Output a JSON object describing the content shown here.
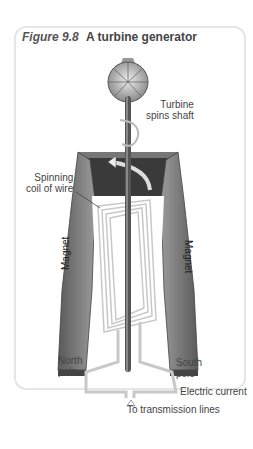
{
  "figure": {
    "number": "Figure 9.8",
    "caption": "A turbine generator"
  },
  "labels": {
    "turbine_line1": "Turbine",
    "turbine_line2": "spins shaft",
    "coil_line1": "Spinning",
    "coil_line2": "coil of wire",
    "magnet_left": "Magnet",
    "magnet_right": "Magnet",
    "north_line1": "North",
    "north_line2": "pole",
    "south_line1": "South",
    "south_line2": "pole",
    "current": "Electric current",
    "transmission": "To transmission lines"
  },
  "colors": {
    "magnet_dark": "#3a3a3a",
    "magnet_mid": "#7a7a7a",
    "magnet_light": "#a8a8a8",
    "wire": "#c8c8c8",
    "shaft": "#555555"
  }
}
